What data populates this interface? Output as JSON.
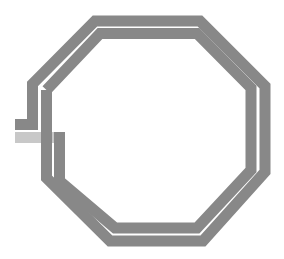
{
  "diagram": {
    "type": "octagonal-spiral-inductor",
    "turns": 2,
    "colors": {
      "trace": "#888888",
      "underpass": "#c8c8c8",
      "background": "#ffffff"
    },
    "trace_width": 11,
    "outer_turn_path": "15,124.5 32.5,124.5 32.5,84 95,21 200,21 265,86 265,172 203,241 110,241 46.5,178 46.5,90",
    "inner_turn_path": "46.5,90 100,33.5 197,33.5 251,88 251,170 197,228 115,228 59.5,181 59.5,132",
    "underpass_path": "15,137.5 64,137.5"
  }
}
